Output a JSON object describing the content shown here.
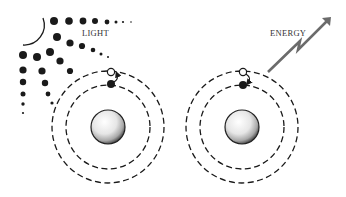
{
  "labels": {
    "light": "LIGHT",
    "energy": "ENERGY"
  },
  "colors": {
    "ink": "#1a1a1a",
    "arrow": "#6b6b6b",
    "nucleus_light": "#f4f4f4",
    "nucleus_dark": "#9a9a9a"
  },
  "atoms": [
    {
      "name": "absorbing-atom",
      "center": [
        108,
        127
      ],
      "outer_orbit_radius": 56,
      "inner_orbit_radius": 42,
      "nucleus_radius": 17,
      "excited_electron_position": [
        111,
        72
      ],
      "ground_electron_position": [
        111,
        84
      ],
      "transition": "up"
    },
    {
      "name": "emitting-atom",
      "center": [
        242,
        127
      ],
      "outer_orbit_radius": 56,
      "inner_orbit_radius": 42,
      "nucleus_radius": 17,
      "excited_electron_position": [
        243,
        72
      ],
      "ground_electron_position": [
        243,
        85
      ],
      "transition": "down"
    }
  ],
  "icons": {
    "light_source": "sun-arc-with-ray-dots",
    "energy_emission": "lightning-arrow"
  }
}
